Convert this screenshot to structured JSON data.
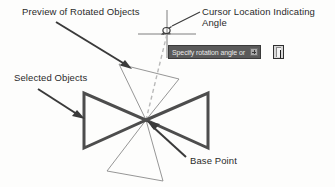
{
  "figure": {
    "background": "#fdfdfc",
    "ink_color": "#2a2a2a",
    "selected_object_color": "#4a4a4a",
    "preview_color": "#7d7d7d",
    "dashed_guide_color": "#b4b4b4"
  },
  "labels": {
    "preview": "Preview of Rotated Objects",
    "cursor": "Cursor Location Indicating\nAngle",
    "selected": "Selected Objects",
    "base_point": "Base Point"
  },
  "prompt": {
    "text": "Specify rotation angle or",
    "expand_icon": "plus-box-icon",
    "input_value": "",
    "background": "#5a5a5a",
    "text_color": "#e8e8e8"
  },
  "icons": {
    "crosshair": "crosshair-cursor-icon",
    "rotate_cursor": "rotate-cursor-icon",
    "arrow": "leader-arrow-icon"
  },
  "geometry": {
    "base_point": [
      146,
      120
    ],
    "selected_left_triangle": [
      [
        84,
        93
      ],
      [
        84,
        148
      ],
      [
        146,
        120
      ]
    ],
    "selected_right_triangle": [
      [
        146,
        120
      ],
      [
        208,
        93
      ],
      [
        208,
        148
      ]
    ],
    "preview_upper_triangle": [
      [
        146,
        120
      ],
      [
        120,
        65
      ],
      [
        178,
        80
      ]
    ],
    "preview_lower_triangle": [
      [
        146,
        120
      ],
      [
        108,
        172
      ],
      [
        162,
        180
      ]
    ],
    "dashed_guide": [
      [
        146,
        120
      ],
      [
        167,
        33
      ]
    ],
    "crosshair_center": [
      167,
      33
    ]
  }
}
